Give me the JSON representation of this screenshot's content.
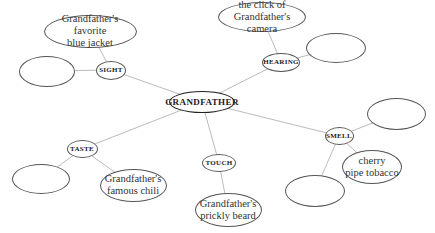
{
  "diagram": {
    "type": "web / concept map",
    "center": {
      "label": "GRANDFATHER",
      "x": 202,
      "y": 102,
      "w": 66,
      "h": 22
    },
    "line_color": "#bbbbbb",
    "senses": [
      {
        "id": "sight",
        "label": "SIGHT",
        "x": 111,
        "y": 70,
        "w": 30,
        "h": 19,
        "details": [
          {
            "label": "Grandfather's favorite blue jacket",
            "lines": [
              "Grandfather's favorite",
              "blue jacket"
            ],
            "x": 90,
            "y": 31,
            "w": 93,
            "h": 33
          },
          {
            "label": "",
            "lines": [],
            "x": 47,
            "y": 71,
            "w": 56,
            "h": 31
          }
        ]
      },
      {
        "id": "hearing",
        "label": "HEARING",
        "x": 281,
        "y": 62,
        "w": 38,
        "h": 19,
        "details": [
          {
            "label": "the click of Grandfather's camera",
            "lines": [
              "the click of",
              "Grandfather's camera"
            ],
            "x": 262,
            "y": 17,
            "w": 88,
            "h": 30
          },
          {
            "label": "",
            "lines": [],
            "x": 336,
            "y": 48,
            "w": 60,
            "h": 30
          }
        ]
      },
      {
        "id": "smell",
        "label": "SMELL",
        "x": 339,
        "y": 136,
        "w": 29,
        "h": 18,
        "details": [
          {
            "label": "",
            "lines": [],
            "x": 396,
            "y": 114,
            "w": 59,
            "h": 32
          },
          {
            "label": "cherry pipe tobacco",
            "lines": [
              "cherry",
              "pipe tobacco"
            ],
            "x": 372,
            "y": 167,
            "w": 60,
            "h": 34
          },
          {
            "label": "",
            "lines": [],
            "x": 315,
            "y": 191,
            "w": 60,
            "h": 32
          }
        ]
      },
      {
        "id": "touch",
        "label": "TOUCH",
        "x": 219,
        "y": 163,
        "w": 34,
        "h": 18,
        "details": [
          {
            "label": "Grandfather's prickly beard",
            "lines": [
              "Grandfather's",
              "prickly beard"
            ],
            "x": 228,
            "y": 210,
            "w": 67,
            "h": 34
          }
        ]
      },
      {
        "id": "taste",
        "label": "TASTE",
        "x": 82,
        "y": 149,
        "w": 31,
        "h": 18,
        "details": [
          {
            "label": "",
            "lines": [],
            "x": 41,
            "y": 179,
            "w": 58,
            "h": 30
          },
          {
            "label": "Grandfather's famous chili",
            "lines": [
              "Grandfather's",
              "famous chili"
            ],
            "x": 133,
            "y": 185,
            "w": 67,
            "h": 33
          }
        ]
      }
    ]
  }
}
